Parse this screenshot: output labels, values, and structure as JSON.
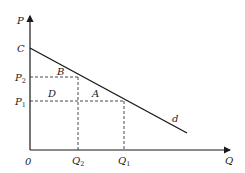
{
  "diagram": {
    "type": "economics-demand-curve",
    "axes": {
      "y_label": "P",
      "x_label": "Q",
      "origin_label": "0"
    },
    "curve": {
      "label": "d",
      "intercept_label": "C"
    },
    "price_levels": [
      {
        "label": "P",
        "sub": "2"
      },
      {
        "label": "P",
        "sub": "1"
      }
    ],
    "quantity_levels": [
      {
        "label": "Q",
        "sub": "2"
      },
      {
        "label": "Q",
        "sub": "1"
      }
    ],
    "regions": {
      "B": "B",
      "D": "D",
      "A": "A"
    },
    "colors": {
      "line": "#1a1a1a",
      "dash": "#333333",
      "text": "#222222"
    }
  }
}
